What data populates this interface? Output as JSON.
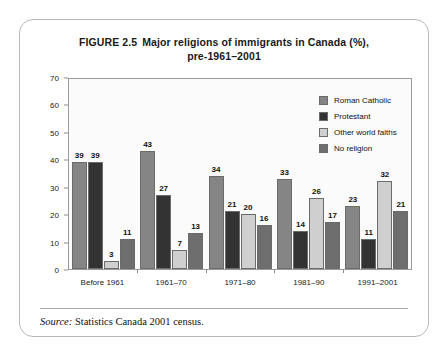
{
  "figure": {
    "number": "FIGURE 2.5",
    "title_main": "Major religions of immigrants in Canada (%),",
    "title_sub": "pre-1961–2001",
    "source_label": "Source:",
    "source_text": " Statistics Canada 2001 census."
  },
  "chart_data": {
    "type": "bar",
    "xlabel": "",
    "ylabel": "",
    "ylim": [
      0,
      70
    ],
    "yticks": [
      0,
      10,
      20,
      30,
      40,
      50,
      60,
      70
    ],
    "grid": false,
    "legend_position": "top-right",
    "categories": [
      "Before 1961",
      "1961–70",
      "1971–80",
      "1981–90",
      "1991–2001"
    ],
    "series": [
      {
        "name": "Roman Catholic",
        "color": "#858585",
        "values": [
          39,
          43,
          34,
          33,
          23
        ]
      },
      {
        "name": "Protestant",
        "color": "#333333",
        "values": [
          39,
          27,
          21,
          14,
          11
        ]
      },
      {
        "name": "Other world faiths",
        "color": "#cfcfcf",
        "values": [
          3,
          7,
          20,
          26,
          32
        ]
      },
      {
        "name": "No religion",
        "color": "#6e6e6e",
        "values": [
          11,
          13,
          16,
          17,
          21
        ]
      }
    ]
  }
}
